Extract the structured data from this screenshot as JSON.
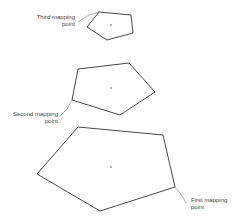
{
  "labels": {
    "third": [
      "Third mapping",
      "point"
    ],
    "second": [
      "Second mapping",
      "point"
    ],
    "first": [
      "First mapping",
      "point"
    ]
  },
  "shapes": {
    "third_pentagon": "99,12 131,15 133,33 107,40 87,27",
    "second_pentagon": "78,69 129,63 155,92 120,115 72,100",
    "first_pentagon": "78,127 163,135 175,187 100,211 37,174"
  },
  "colors": {
    "stroke": "#333333",
    "label": "#444444"
  }
}
